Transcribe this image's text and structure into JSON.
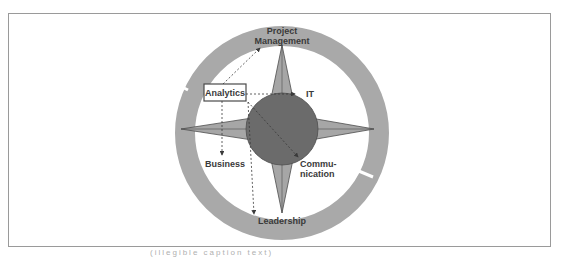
{
  "diagram": {
    "type": "compass-star-concept",
    "labels": {
      "top": "Project",
      "top_line2": "Management",
      "bottom": "Leadership",
      "analytics": "Analytics",
      "it": "IT",
      "business": "Business",
      "communication_line1": "Commu-",
      "communication_line2": "nication"
    },
    "arrows": [
      {
        "from": "Analytics",
        "to": "Project Management",
        "style": "dashed"
      },
      {
        "from": "Analytics",
        "to": "IT",
        "style": "dashed"
      },
      {
        "from": "Analytics",
        "to": "Business",
        "style": "dashed"
      },
      {
        "from": "Analytics",
        "to": "Communication",
        "style": "dashed"
      },
      {
        "from": "Analytics",
        "to": "Leadership",
        "style": "dashed"
      }
    ],
    "colors": {
      "ring": "#a9a9a9",
      "star_fill": "#a6a6a6",
      "star_stroke": "#4d4d4d",
      "center_circle": "#6b6b6b",
      "text": "#3a3a3a",
      "frame_border": "#9a9a9a"
    }
  },
  "caption": "(illegible caption text)"
}
